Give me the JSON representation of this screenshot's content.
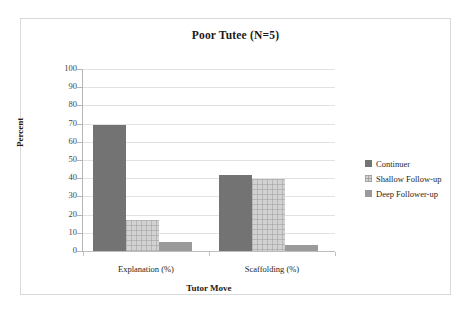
{
  "chart_data": {
    "type": "bar",
    "title": "Poor Tutee (N=5)",
    "xlabel": "Tutor Move",
    "ylabel": "Percent",
    "categories": [
      "Explanation (%)",
      "Scaffolding (%)"
    ],
    "series": [
      {
        "name": "Continuer",
        "values": [
          69,
          42
        ],
        "color": "#737373"
      },
      {
        "name": "Shallow Follow-up",
        "values": [
          17,
          39.5
        ],
        "color": "#d2d2d2"
      },
      {
        "name": "Deep Follower-up",
        "values": [
          5,
          3.5
        ],
        "color": "#9a9a9a"
      }
    ],
    "ylim": [
      0,
      100
    ],
    "yticks": [
      100,
      90,
      80,
      70,
      60,
      50,
      40,
      30,
      20,
      10,
      0
    ],
    "ytick_labels": [
      "100",
      "90",
      "80",
      "70",
      "60",
      "50",
      "40",
      "30",
      "20",
      "10",
      "0"
    ],
    "grid": true,
    "legend_position": "right",
    "plot_background": "#ffffff",
    "gridline_color": "#e2e2e2",
    "border_color": "#d9d9d9"
  },
  "legend": {
    "items": [
      {
        "label": "Continuer"
      },
      {
        "label": "Shallow Follow-up"
      },
      {
        "label": "Deep Follower-up"
      }
    ]
  },
  "axes": {
    "y_title": "Percent",
    "x_title": "Tutor Move",
    "y_labels": [
      "100",
      "90",
      "80",
      "70",
      "60",
      "50",
      "40",
      "30",
      "20",
      "10",
      "0"
    ],
    "x_labels": [
      "Explanation (%)",
      "Scaffolding (%)"
    ]
  },
  "header": {
    "title": "Poor Tutee (N=5)"
  }
}
